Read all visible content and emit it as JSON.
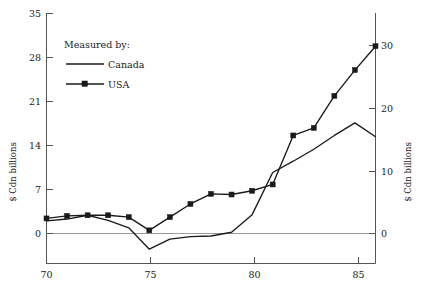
{
  "chart_data": {
    "type": "line",
    "title": "",
    "xlabel": "",
    "ylabel": "$ Cdn billions",
    "y2label": "$ Cdn billions",
    "legend_title": "Measured by:",
    "legend_position": "upper-left-inside",
    "grid": false,
    "xlim": [
      70,
      86
    ],
    "ylim": [
      -3.5,
      35
    ],
    "y2lim": [
      -5,
      50
    ],
    "xticks": [
      70,
      75,
      80,
      85
    ],
    "xticklabels": [
      "70",
      "75",
      "80",
      "85"
    ],
    "yticks": [
      0,
      7,
      14,
      21,
      28,
      35
    ],
    "yticklabels": [
      "0",
      "7",
      "14",
      "21",
      "28",
      "35"
    ],
    "y2ticks": [
      0,
      10,
      20,
      30
    ],
    "y2ticklabels": [
      "0",
      "10",
      "20",
      "30"
    ],
    "x": [
      70,
      71,
      72,
      73,
      74,
      75,
      76,
      77,
      78,
      79,
      80,
      81,
      82,
      83,
      84,
      85,
      86
    ],
    "series": [
      {
        "name": "Canada",
        "marker": "none",
        "values": [
          2.0,
          2.3,
          2.9,
          2.1,
          0.9,
          -2.5,
          -0.9,
          -0.5,
          -0.4,
          0.2,
          3.0,
          9.7,
          11.5,
          13.4,
          15.6,
          17.6,
          15.4
        ]
      },
      {
        "name": "USA",
        "marker": "square",
        "values": [
          2.4,
          2.8,
          2.9,
          2.9,
          2.6,
          0.5,
          2.6,
          4.7,
          6.3,
          6.2,
          6.8,
          7.8,
          15.6,
          16.8,
          21.9,
          26.0,
          29.8
        ]
      }
    ]
  },
  "legend": {
    "title": "Measured by:",
    "entries": [
      {
        "label": "Canada",
        "style": "line"
      },
      {
        "label": "USA",
        "style": "line-marker"
      }
    ]
  },
  "axes": {
    "left_title": "$ Cdn billions",
    "right_title": "$ Cdn billions"
  },
  "colors": {
    "line": "#1a1a1a",
    "axis": "#555555",
    "zero": "#9a9a9a",
    "background": "#ffffff"
  }
}
